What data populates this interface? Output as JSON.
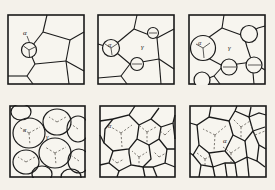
{
  "figure": {
    "background_color": "#f4f1ea",
    "line_color": "#1a1a1a",
    "dashed_color": "#55514b",
    "rows": 2,
    "columns": 3,
    "panel_count": 6
  },
  "labels": {
    "alpha": "α",
    "gamma": "γ"
  },
  "panels": [
    {
      "id": "panel-1",
      "name": "nucleation-stage",
      "index": 1,
      "row": 1,
      "column": 1,
      "phase_labels": [
        "α"
      ],
      "nuclei_count": 1,
      "description": "Single small alpha nucleus at a grain triple junction in the parent matrix"
    },
    {
      "id": "panel-2",
      "name": "early-growth-stage",
      "index": 2,
      "row": 1,
      "column": 2,
      "phase_labels": [
        "α",
        "γ"
      ],
      "nuclei_count": 3,
      "description": "Several alpha nuclei formed on gamma grain boundaries"
    },
    {
      "id": "panel-3",
      "name": "grain-growth-stage",
      "index": 3,
      "row": 1,
      "column": 3,
      "phase_labels": [
        "α",
        "γ"
      ],
      "nuclei_count": 5,
      "description": "Alpha particles grown larger, consuming the gamma matrix"
    },
    {
      "id": "panel-4",
      "name": "impingement-stage",
      "index": 4,
      "row": 2,
      "column": 1,
      "phase_labels": [
        "α",
        "γ"
      ],
      "nuclei_count": 9,
      "description": "Large rounded alpha grains beginning to impinge on one another"
    },
    {
      "id": "panel-5",
      "name": "late-impingement-stage",
      "index": 5,
      "row": 2,
      "column": 2,
      "phase_labels": [
        "α"
      ],
      "nuclei_count": 14,
      "description": "Grains impinged into polygonal shapes, residual gamma nearly gone"
    },
    {
      "id": "panel-6",
      "name": "completed-structure-stage",
      "index": 6,
      "row": 2,
      "column": 3,
      "phase_labels": [
        "α"
      ],
      "nuclei_count": 14,
      "description": "Fully transformed equiaxed alpha grain structure"
    }
  ]
}
